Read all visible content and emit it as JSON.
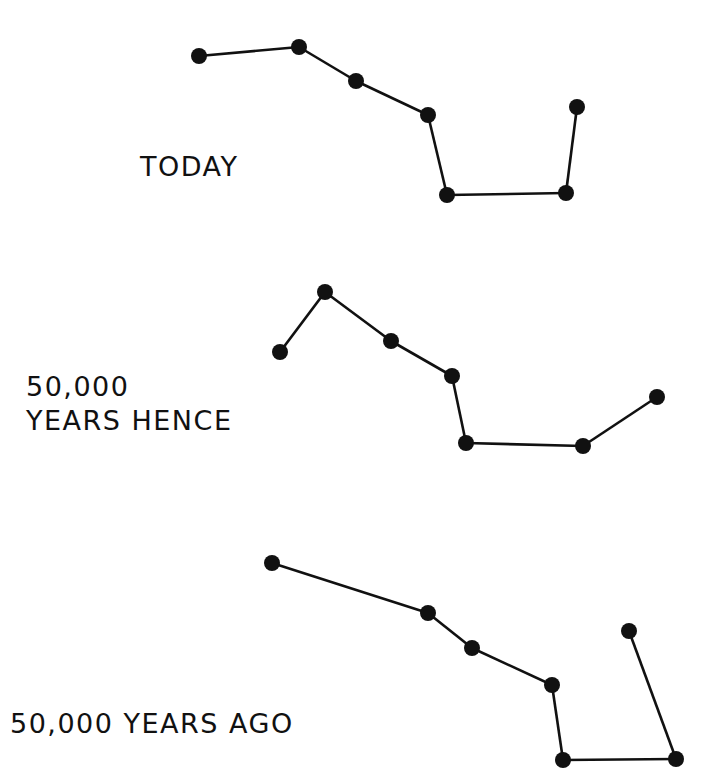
{
  "figure": {
    "panels": [
      {
        "label": "TODAY",
        "label_lines": [
          "TODAY"
        ],
        "label_pos": [
          140,
          150
        ],
        "stars": [
          [
            199,
            56
          ],
          [
            299,
            47
          ],
          [
            356,
            81
          ],
          [
            428,
            115
          ],
          [
            447,
            195
          ],
          [
            566,
            193
          ],
          [
            577,
            107
          ]
        ]
      },
      {
        "label": "50,000 YEARS HENCE",
        "label_lines": [
          "50,000",
          "YEARS HENCE"
        ],
        "label_pos": [
          26,
          370
        ],
        "stars": [
          [
            280,
            352
          ],
          [
            325,
            292
          ],
          [
            391,
            341
          ],
          [
            452,
            376
          ],
          [
            466,
            443
          ],
          [
            583,
            446
          ],
          [
            657,
            397
          ]
        ]
      },
      {
        "label": "50,000 YEARS AGO",
        "label_lines": [
          "50,000 YEARS AGO"
        ],
        "label_pos": [
          10,
          707
        ],
        "stars": [
          [
            272,
            563
          ],
          [
            428,
            613
          ],
          [
            472,
            648
          ],
          [
            552,
            685
          ],
          [
            563,
            760
          ],
          [
            676,
            759
          ],
          [
            629,
            631
          ]
        ]
      }
    ],
    "colors": {
      "ink": "#111111",
      "background": "#ffffff"
    }
  }
}
